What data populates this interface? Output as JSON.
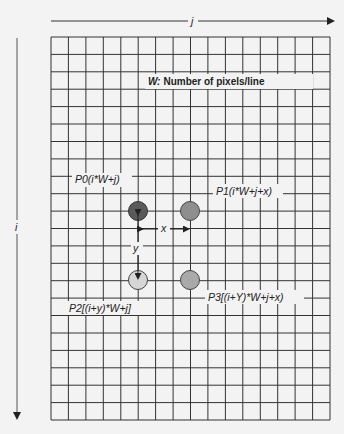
{
  "diagram": {
    "title_label": "Number of pixels/line",
    "title_prefix": "W:",
    "axis_j": "j",
    "axis_i": "i",
    "grid": {
      "columns": 16,
      "rows": 22
    },
    "points": [
      {
        "id": "P0",
        "label": "P0(i*W+j)",
        "color": "#5a5a5a"
      },
      {
        "id": "P1",
        "label": "P1(i*W+j+x)",
        "color": "#8e8e8e"
      },
      {
        "id": "P2",
        "label": "P2[(i+y)*W+j]",
        "color": "#d6d6d6"
      },
      {
        "id": "P3",
        "label": "P3[(i+Y)*W+j+x)",
        "color": "#a9a9a9"
      }
    ],
    "offset_x_label": "x",
    "offset_y_label": "y"
  }
}
